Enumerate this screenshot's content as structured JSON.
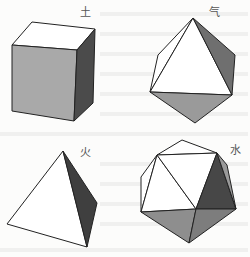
{
  "figure": {
    "solids": [
      {
        "name": "cube",
        "element_label": "土",
        "element_meaning": "earth",
        "label_pos": [
          80,
          7
        ],
        "faces": [
          {
            "name": "top",
            "points": "32,22 95,29 77,50 12,45",
            "fill": "#ffffff"
          },
          {
            "name": "front",
            "points": "12,45 77,50 74,121 12,111",
            "fill": "#a9a9a9"
          },
          {
            "name": "right",
            "points": "77,50 95,29 93,103 74,121",
            "fill": "#4b4b4b"
          }
        ]
      },
      {
        "name": "octahedron",
        "element_label": "气",
        "element_meaning": "air",
        "label_pos": [
          210,
          7
        ],
        "faces": [
          {
            "name": "back-left",
            "points": "193,18 158,55 150,92",
            "fill": "#ffffff"
          },
          {
            "name": "front",
            "points": "193,18 150,92 232,95",
            "fill": "#ffffff"
          },
          {
            "name": "right",
            "points": "193,18 232,95 235,55",
            "fill": "#6f6f6f"
          },
          {
            "name": "bottom",
            "points": "150,92 232,95 195,123",
            "fill": "#9a9a9a"
          }
        ]
      },
      {
        "name": "tetrahedron",
        "element_label": "火",
        "element_meaning": "fire",
        "label_pos": [
          80,
          147
        ],
        "faces": [
          {
            "name": "front",
            "points": "63,151 7,224 87,247",
            "fill": "#ffffff"
          },
          {
            "name": "right",
            "points": "63,151 87,247 97,203",
            "fill": "#3f3f3f"
          }
        ]
      },
      {
        "name": "icosahedron",
        "element_label": "水",
        "element_meaning": "water",
        "label_pos": [
          230,
          145
        ],
        "faces": [
          {
            "name": "top",
            "points": "157,155 182,140 217,153",
            "fill": "#ffffff"
          },
          {
            "name": "upper-left-outer",
            "points": "157,155 141,177 141,212",
            "fill": "#ffffff"
          },
          {
            "name": "upper-left-inner",
            "points": "157,155 141,212 196,209",
            "fill": "#ffffff"
          },
          {
            "name": "upper-center",
            "points": "157,155 217,153 196,209",
            "fill": "#ffffff"
          },
          {
            "name": "right-dark",
            "points": "217,153 236,209 196,209",
            "fill": "#474747"
          },
          {
            "name": "right-edge",
            "points": "217,153 227,165 236,209",
            "fill": "#9a9a9a"
          },
          {
            "name": "bottom-left",
            "points": "141,212 196,209 189,243",
            "fill": "#8e8e8e"
          },
          {
            "name": "bottom-right",
            "points": "196,209 236,209 189,243",
            "fill": "#7d7d7d"
          }
        ]
      }
    ]
  }
}
